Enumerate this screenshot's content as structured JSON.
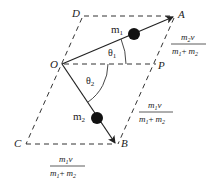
{
  "diagram": {
    "points": {
      "O": "O",
      "A": "A",
      "B": "B",
      "C": "C",
      "D": "D",
      "P": "P"
    },
    "masses": {
      "m1": {
        "base": "m",
        "sub": "1"
      },
      "m2": {
        "base": "m",
        "sub": "2"
      }
    },
    "angles": {
      "theta1": {
        "base": "θ",
        "sub": "1"
      },
      "theta2": {
        "base": "θ",
        "sub": "2"
      }
    },
    "fractions": {
      "side_PA": {
        "num_base": "m",
        "num_sub": "2",
        "num_tail": "v",
        "den_a": "m",
        "den_a_sub": "1",
        "den_op": "+",
        "den_b": "m",
        "den_b_sub": "2"
      },
      "side_PB": {
        "num_base": "m",
        "num_sub": "1",
        "num_tail": "v",
        "den_a": "m",
        "den_a_sub": "1",
        "den_op": "+",
        "den_b": "m",
        "den_b_sub": "2"
      },
      "side_CB": {
        "num_base": "m",
        "num_sub": "1",
        "num_tail": "v",
        "den_a": "m",
        "den_a_sub": "1",
        "den_op": "+",
        "den_b": "m",
        "den_b_sub": "2"
      }
    },
    "colors": {
      "line": "#222222",
      "ball": "#111111"
    }
  }
}
